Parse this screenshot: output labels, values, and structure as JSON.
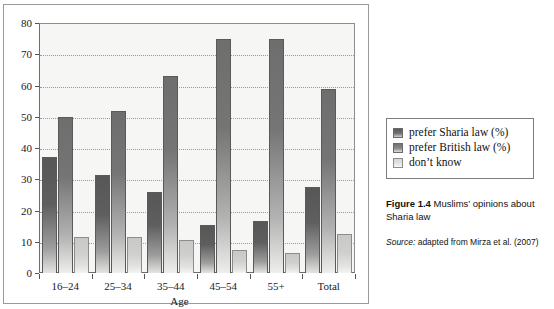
{
  "chart_data": {
    "type": "bar",
    "title": "",
    "xlabel": "Age",
    "ylabel": "",
    "ylim": [
      0,
      80
    ],
    "yticks": [
      0,
      10,
      20,
      30,
      40,
      50,
      60,
      70,
      80
    ],
    "grid": true,
    "legend_position": "right",
    "categories": [
      "16–24",
      "25–34",
      "35–44",
      "45–54",
      "55+",
      "Total"
    ],
    "series": [
      {
        "name": "prefer Sharia law (%)",
        "color": "#5e5e5e",
        "values": [
          37,
          31.5,
          26,
          15.5,
          16.5,
          27.5
        ]
      },
      {
        "name": "prefer British law (%)",
        "color": "#757575",
        "values": [
          50,
          52,
          63,
          75,
          75,
          59
        ]
      },
      {
        "name": "don't know",
        "color": "#cfcfcd",
        "values": [
          11.5,
          11.5,
          10.5,
          7.5,
          6.5,
          12.5
        ]
      }
    ]
  },
  "legend": {
    "items": [
      {
        "label": "prefer Sharia law (%)",
        "swatch": "series-0-swatch"
      },
      {
        "label": "prefer British law (%)",
        "swatch": "series-1-swatch"
      },
      {
        "label": "don’t know",
        "swatch": "series-2-swatch"
      }
    ]
  },
  "caption": {
    "figure_number": "Figure 1.4",
    "text": " Muslims’ opinions about Sharia law"
  },
  "source": {
    "prefix": "Source:",
    "text": " adapted from Mirza et al. (2007)"
  }
}
